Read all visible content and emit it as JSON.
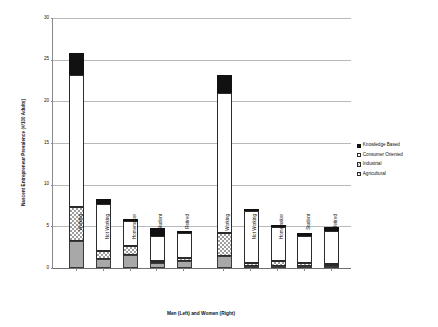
{
  "chart_data": {
    "type": "bar",
    "subtype": "stacked",
    "title": "",
    "xlabel": "Men (Left) and Women (Right)",
    "ylabel": "Nascent Entrepreneur Prevalence (#/100 Adults)",
    "ylim": [
      0,
      30
    ],
    "yticks": [
      0,
      5,
      10,
      15,
      20,
      25,
      30
    ],
    "ytick_labels": [
      "0",
      "5",
      "10",
      "15",
      "20",
      "25",
      "30"
    ],
    "grid": true,
    "legend_position": "right",
    "categories": [
      "Working",
      "Not Working",
      "Homemaker",
      "Student",
      "Retired",
      "Working",
      "Not Working",
      "Homemaker",
      "Student",
      "Retired"
    ],
    "groups": [
      {
        "name": "Men",
        "categories": [
          "Working",
          "Not Working",
          "Homemaker",
          "Student",
          "Retired"
        ]
      },
      {
        "name": "Women",
        "categories": [
          "Working",
          "Not Working",
          "Homemaker",
          "Student",
          "Retired"
        ]
      }
    ],
    "series": [
      {
        "name": "Agricultural",
        "color": "#a8a8a8",
        "values": [
          3.3,
          1.1,
          1.6,
          0.6,
          0.9,
          1.5,
          0.3,
          0.3,
          0.25,
          0.25
        ]
      },
      {
        "name": "Industrial",
        "color": "#ffffff",
        "values": [
          4.0,
          0.9,
          1.0,
          0.3,
          0.3,
          2.7,
          0.3,
          0.6,
          0.35,
          0.25
        ]
      },
      {
        "name": "Consumer Oriented",
        "color": "#ffffff",
        "values": [
          15.9,
          5.7,
          3.0,
          3.0,
          3.0,
          16.8,
          6.3,
          4.0,
          3.2,
          3.9
        ]
      },
      {
        "name": "Knowledge Based",
        "color": "#111111",
        "values": [
          2.6,
          0.6,
          0.3,
          0.9,
          0.2,
          2.2,
          0.2,
          0.15,
          0.45,
          0.5
        ]
      }
    ],
    "totals": [
      25.8,
      8.3,
      5.9,
      4.8,
      4.4,
      23.2,
      7.1,
      5.05,
      4.25,
      4.9
    ]
  },
  "legend": {
    "entries": [
      {
        "label": "Knowledge Based",
        "swatch": "know"
      },
      {
        "label": "Consumer Oriented",
        "swatch": "cons"
      },
      {
        "label": "Industrial",
        "swatch": "ind"
      },
      {
        "label": "Agricultural",
        "swatch": "agri"
      }
    ]
  }
}
